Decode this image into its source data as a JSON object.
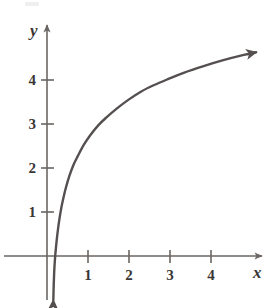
{
  "figure": {
    "background_color": "#ffffff",
    "width": 276,
    "height": 308
  },
  "axes": {
    "x_axis_label": "x",
    "y_axis_label": "y",
    "axis_color": "#6b6663",
    "origin_px": {
      "x": 47,
      "y": 256
    },
    "x_unit_px": 41,
    "y_unit_px": 44,
    "x_ticks": [
      {
        "label": "1",
        "value": 1
      },
      {
        "label": "2",
        "value": 2
      },
      {
        "label": "3",
        "value": 3
      },
      {
        "label": "4",
        "value": 4
      }
    ],
    "y_ticks": [
      {
        "label": "1",
        "value": 1
      },
      {
        "label": "2",
        "value": 2
      },
      {
        "label": "3",
        "value": 3
      },
      {
        "label": "4",
        "value": 4
      }
    ]
  },
  "chart_data": {
    "type": "line",
    "title": "",
    "subtitle": "",
    "xlabel": "x",
    "ylabel": "y",
    "xlim": [
      -0.2,
      5.3
    ],
    "ylim": [
      -1.0,
      5.2
    ],
    "grid": false,
    "legend": null,
    "series": [
      {
        "name": "logarithmic curve",
        "color": "#55504f",
        "line_width": 2.4,
        "arrow_start": true,
        "arrow_end": true,
        "x": [
          0.155,
          0.16,
          0.17,
          0.18,
          0.2,
          0.23,
          0.26,
          0.3,
          0.35,
          0.4,
          0.46,
          0.55,
          0.65,
          0.75,
          0.9,
          1.05,
          1.25,
          1.45,
          1.7,
          2.0,
          2.3,
          2.6,
          2.95,
          3.35,
          3.8,
          4.3,
          4.8,
          5.1
        ],
        "y": [
          -1.0,
          -0.78,
          -0.5,
          -0.28,
          0.0,
          0.3,
          0.55,
          0.82,
          1.1,
          1.32,
          1.55,
          1.83,
          2.08,
          2.27,
          2.53,
          2.74,
          2.97,
          3.15,
          3.35,
          3.56,
          3.74,
          3.88,
          4.02,
          4.17,
          4.31,
          4.45,
          4.57,
          4.63
        ]
      }
    ],
    "annotations": []
  }
}
